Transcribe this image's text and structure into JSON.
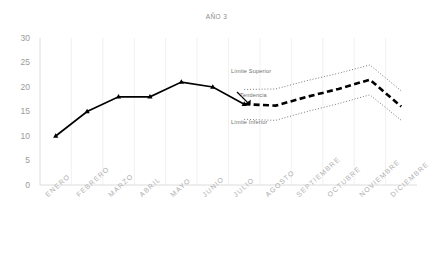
{
  "chart_data": {
    "type": "line",
    "title": "AÑO 3",
    "xlabel": "",
    "ylabel": "",
    "ylim": [
      0,
      30
    ],
    "yticks": [
      "0",
      "5",
      "10",
      "15",
      "20",
      "25",
      "30"
    ],
    "grid": "vertical-light",
    "legend_position": "inline-annotations",
    "categories": [
      "ENERO",
      "FEBRERO",
      "MARZO",
      "ABRIL",
      "MAYO",
      "JUNIO",
      "JULIO",
      "AGOSTO",
      "SEPTIEMBRE",
      "OCTUBRE",
      "NOVIEMBRE",
      "DICIEMBRE"
    ],
    "series": [
      {
        "name": "Histórico",
        "style": "solid-with-triangle-markers",
        "color": "#000000",
        "values": [
          10,
          15,
          18,
          18,
          21,
          20,
          16.5,
          null,
          null,
          null,
          null,
          null
        ]
      },
      {
        "name": "Tendencia",
        "style": "dashed",
        "color": "#000000",
        "values": [
          null,
          null,
          null,
          null,
          null,
          null,
          16.5,
          16.2,
          18,
          19.6,
          21.5,
          16
        ]
      },
      {
        "name": "Límite Superior",
        "style": "dotted",
        "color": "#7a7a7a",
        "values": [
          null,
          null,
          null,
          null,
          null,
          null,
          19.5,
          19.6,
          21.3,
          22.8,
          24.5,
          19.2
        ]
      },
      {
        "name": "Límite Inferior",
        "style": "dotted",
        "color": "#7a7a7a",
        "values": [
          null,
          null,
          null,
          null,
          null,
          null,
          13.4,
          13.2,
          15,
          16.6,
          18.4,
          13.2
        ]
      }
    ],
    "annotations": [
      {
        "text": "Límite Superior",
        "target": "Límite Superior"
      },
      {
        "text": "Tendencia",
        "target": "Tendencia"
      },
      {
        "text": "Límite Inferior",
        "target": "Límite Inferior"
      }
    ]
  }
}
